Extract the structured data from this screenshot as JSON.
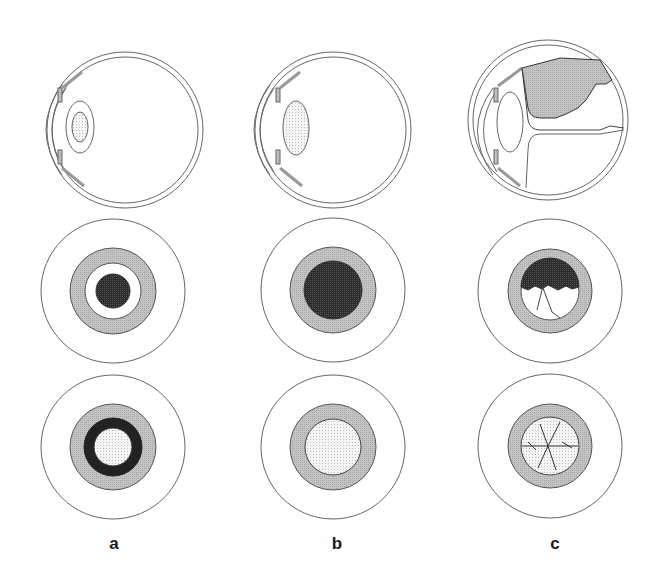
{
  "figure": {
    "panels": [
      {
        "label": "a",
        "eye_cx": 125,
        "circle_cx": 113
      },
      {
        "label": "b",
        "eye_cx": 330,
        "circle_cx": 333
      },
      {
        "label": "c",
        "eye_cx": 545,
        "circle_cx": 550
      }
    ],
    "colors": {
      "line": "#555555",
      "iris_gray": "#b8b8b8",
      "dark_reflex": "#2a2a2a",
      "light_stipple": "#e8e8e8",
      "detachment_gray": "#bdbdbd"
    }
  }
}
